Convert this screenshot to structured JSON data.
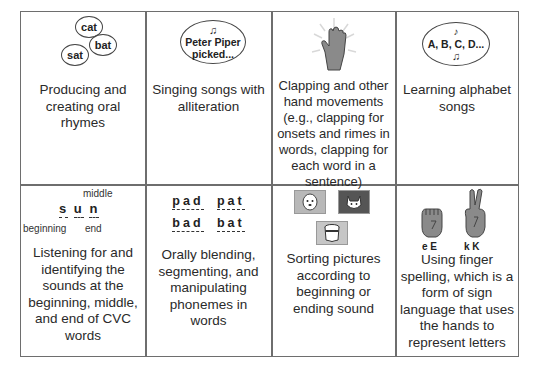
{
  "cells": [
    {
      "caption": "Producing and creating oral rhymes",
      "bubbles": [
        "cat",
        "bat",
        "sat"
      ]
    },
    {
      "caption": "Singing songs with alliteration",
      "bubble_line1": "Peter Piper",
      "bubble_line2": "picked...",
      "note_icon": "music-note-icon"
    },
    {
      "caption": "Clapping and other hand movements (e.g., clapping for onsets and rimes in words, clapping for each word in a sentence)",
      "icon": "clapping-hand-icon"
    },
    {
      "caption": "Learning alphabet songs",
      "bubble_text": "A, B, C, D...",
      "note_icon": "music-note-icon"
    },
    {
      "caption": "Listening for and identifying the sounds at the beginning, middle, and end of CVC words",
      "word_letters": [
        "s",
        "u",
        "n"
      ],
      "label_middle": "middle",
      "label_beginning": "beginning",
      "label_end": "end"
    },
    {
      "caption": "Orally blending, segmenting, and manipulating phonemes in words",
      "words": [
        "pad",
        "pat",
        "bad",
        "bat"
      ]
    },
    {
      "caption": "Sorting pictures according to beginning or ending sound",
      "pictures": [
        "dog-picture-icon",
        "cat-picture-icon",
        "bucket-picture-icon"
      ]
    },
    {
      "caption": "Using finger spelling, which is a form of sign language that uses the hands to represent letters",
      "hand_labels": [
        "e E",
        "k K"
      ]
    }
  ],
  "colors": {
    "border": "#6e6e6e",
    "hand": "#8a8a8a",
    "text": "#2a2a2a"
  }
}
